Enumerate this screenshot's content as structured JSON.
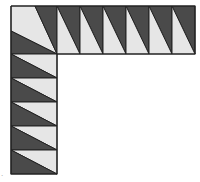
{
  "figure": {
    "colors": {
      "dark": "#4a4a4a",
      "light": "#e6e6e6",
      "outline": "#222222",
      "background": "#ffffff"
    },
    "corner_block": {
      "x": 11,
      "y": 6,
      "size": 46,
      "light_polygon": [
        [
          11,
          6
        ],
        [
          35,
          6
        ],
        [
          57,
          54
        ],
        [
          11,
          31
        ]
      ],
      "dark_top_right": [
        [
          35,
          6
        ],
        [
          57,
          6
        ],
        [
          57,
          54
        ]
      ],
      "dark_bottom_left": [
        [
          11,
          31
        ],
        [
          57,
          54
        ],
        [
          11,
          54
        ]
      ]
    },
    "top_strip": {
      "cell_count": 6,
      "x_start": 57,
      "cell_width": 23,
      "y": 6,
      "height": 48,
      "triangle_orientation": "diagonal top-left to bottom-right; dark upper-right, light lower-left"
    },
    "left_column": {
      "cell_count": 5,
      "y_start": 54,
      "cell_height": 24,
      "x": 11,
      "width": 46,
      "triangle_orientation": "diagonal top-left to bottom-right; light upper-right, dark lower-left"
    },
    "corner_mark": "."
  }
}
